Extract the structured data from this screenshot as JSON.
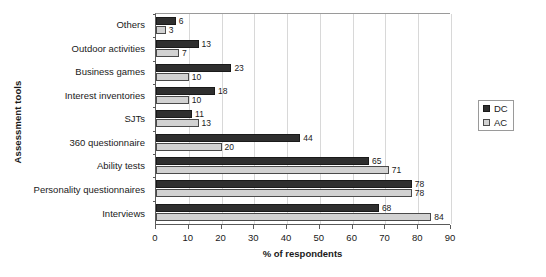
{
  "chart_data": {
    "type": "bar",
    "orientation": "horizontal",
    "title": "",
    "xlabel": "% of respondents",
    "ylabel": "Assessment tools",
    "xlim": [
      0,
      90
    ],
    "xticks": [
      0,
      10,
      20,
      30,
      40,
      50,
      60,
      70,
      80,
      90
    ],
    "grid": true,
    "legend_position": "right",
    "categories": [
      "Others",
      "Outdoor activities",
      "Business games",
      "Interest inventories",
      "SJTs",
      "360 questionnaire",
      "Ability tests",
      "Personality questionnaires",
      "Interviews"
    ],
    "series": [
      {
        "name": "DC",
        "color": "#2f2f2f",
        "values": [
          6,
          13,
          23,
          18,
          11,
          44,
          65,
          78,
          68
        ]
      },
      {
        "name": "AC",
        "color": "#d2d2d2",
        "values": [
          3,
          7,
          10,
          10,
          13,
          20,
          71,
          78,
          84
        ]
      }
    ]
  },
  "legend": {
    "items": [
      {
        "label": "DC"
      },
      {
        "label": "AC"
      }
    ]
  }
}
